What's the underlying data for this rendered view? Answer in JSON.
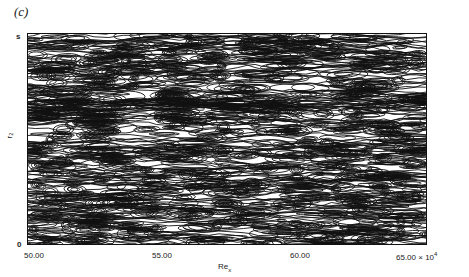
{
  "figure": {
    "panel_label": "(c)",
    "x_axis": {
      "label_main": "Re",
      "label_sub": "x",
      "ticks": [
        "50.00",
        "55.00",
        "60.00",
        "65.00 × 10"
      ],
      "exponent": "4"
    },
    "y_axis": {
      "label": "r₂",
      "ticks": [
        "0",
        "s"
      ]
    }
  },
  "chart_data": {
    "type": "heatmap",
    "title": "(c)",
    "xlabel": "Re_x",
    "ylabel": "r2",
    "x_ticks": [
      50.0,
      55.0,
      60.0,
      65.0
    ],
    "x_scale": "× 10^4",
    "xlim": [
      50.0,
      65.0
    ],
    "y_ticks": [
      "0",
      "s"
    ]
  }
}
